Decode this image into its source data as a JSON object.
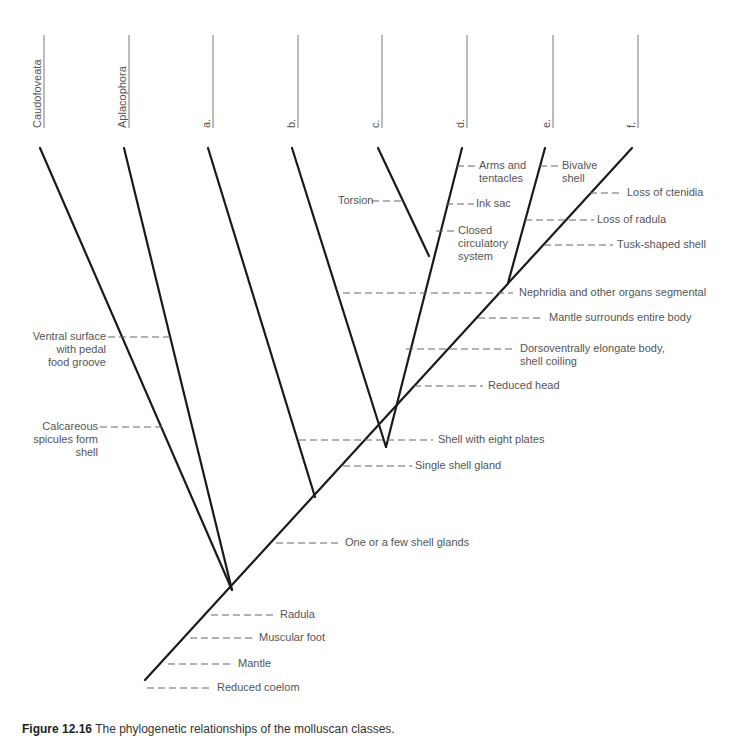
{
  "taxa": [
    {
      "label": "Caudofoveata",
      "x": 44
    },
    {
      "label": "Aplacophora",
      "x": 129
    },
    {
      "label": "a.",
      "x": 213
    },
    {
      "label": "b.",
      "x": 298
    },
    {
      "label": "c.",
      "x": 382
    },
    {
      "label": "d.",
      "x": 467
    },
    {
      "label": "e.",
      "x": 553
    },
    {
      "label": "f.",
      "x": 638
    }
  ],
  "traits": {
    "torsion": "Torsion",
    "arms": [
      "Arms and",
      "tentacles"
    ],
    "ink_sac": "Ink sac",
    "closed_circ": [
      "Closed",
      "circulatory",
      "system"
    ],
    "bivalve": [
      "Bivalve",
      "shell"
    ],
    "loss_ctenidia": "Loss of ctenidia",
    "loss_radula": "Loss of radula",
    "tusk_shell": "Tusk-shaped shell",
    "nephridia": "Nephridia and other organs segmental",
    "mantle_surrounds": "Mantle surrounds entire body",
    "dorsoventral": [
      "Dorsoventrally elongate body,",
      "shell coiling"
    ],
    "reduced_head": "Reduced head",
    "ventral_surface": [
      "Ventral surface",
      "with pedal",
      "food groove"
    ],
    "calcareous": [
      "Calcareous",
      "spicules form",
      "shell"
    ],
    "eight_plates": "Shell with eight plates",
    "single_gland": "Single shell gland",
    "few_glands": "One or a few shell glands",
    "radula": "Radula",
    "muscular_foot": "Muscular foot",
    "mantle": "Mantle",
    "reduced_coelom": "Reduced coelom"
  },
  "caption": {
    "figure": "Figure 12.16",
    "text": "The phylogenetic relationships of the molluscan classes."
  }
}
